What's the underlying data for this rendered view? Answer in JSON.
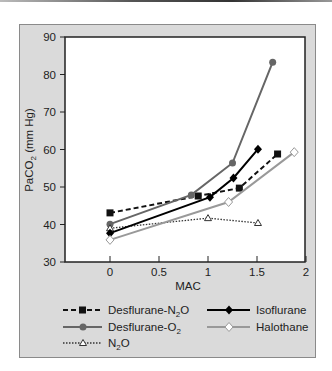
{
  "chart_data": {
    "type": "line",
    "title": "",
    "xlabel": "MAC",
    "ylabel": "PaCO2 (mm Hg)",
    "xlim": [
      -0.45,
      2
    ],
    "ylim": [
      30,
      90
    ],
    "xticks": [
      "0",
      "0.5",
      "1",
      "1.5",
      "2"
    ],
    "yticks": [
      "30",
      "40",
      "50",
      "60",
      "70",
      "80",
      "90"
    ],
    "grid": false,
    "legend_position": "bottom",
    "series": [
      {
        "name": "Desflurane-N2O",
        "style": "dashed",
        "marker": "filled-square",
        "color": "#111111",
        "x": [
          0,
          0.9,
          1.32,
          1.71
        ],
        "y": [
          43.1,
          47.6,
          49.7,
          58.8
        ]
      },
      {
        "name": "Desflurane-O2",
        "style": "solid",
        "marker": "filled-circle",
        "color": "#666666",
        "x": [
          0,
          0.83,
          1.25,
          1.66
        ],
        "y": [
          40.1,
          47.9,
          56.4,
          83.3
        ]
      },
      {
        "name": "N2O",
        "style": "dotted",
        "marker": "open-triangle",
        "color": "#333333",
        "x": [
          0,
          1.0,
          1.51
        ],
        "y": [
          39.0,
          41.7,
          40.4
        ]
      },
      {
        "name": "Isoflurane",
        "style": "solid",
        "marker": "filled-diamond",
        "color": "#000000",
        "x": [
          0,
          1.02,
          1.26,
          1.51
        ],
        "y": [
          37.7,
          47.3,
          52.4,
          60.1
        ]
      },
      {
        "name": "Halothane",
        "style": "solid",
        "marker": "open-diamond",
        "color": "#999999",
        "x": [
          0,
          1.21,
          1.88
        ],
        "y": [
          35.9,
          46.0,
          59.3
        ]
      }
    ]
  },
  "labels": {
    "xlabel": "MAC",
    "ylabel_main": "PaCO",
    "ylabel_sub": "2",
    "ylabel_tail": " (mm Hg)",
    "legend": {
      "des_n2o_main": "Desflurane-N",
      "des_n2o_sub": "2",
      "des_n2o_tail": "O",
      "des_o2_main": "Desflurane-O",
      "des_o2_sub": "2",
      "n2o_main": "N",
      "n2o_sub": "2",
      "n2o_tail": "O",
      "isoflurane": "Isoflurane",
      "halothane": "Halothane"
    }
  }
}
